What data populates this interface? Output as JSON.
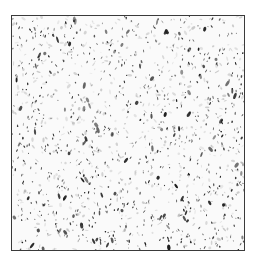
{
  "image": {
    "description": "Grayscale microscopy-like texture of dark elongated specks on a light background inside a thin dark square frame",
    "frame": {
      "x": 11,
      "y": 15,
      "width": 232,
      "height": 234,
      "border_color": "#3a3a3a"
    },
    "background_color": "#fafafa",
    "speck_color": "#1a1a1a",
    "speck_count": 900,
    "seed": 7
  }
}
